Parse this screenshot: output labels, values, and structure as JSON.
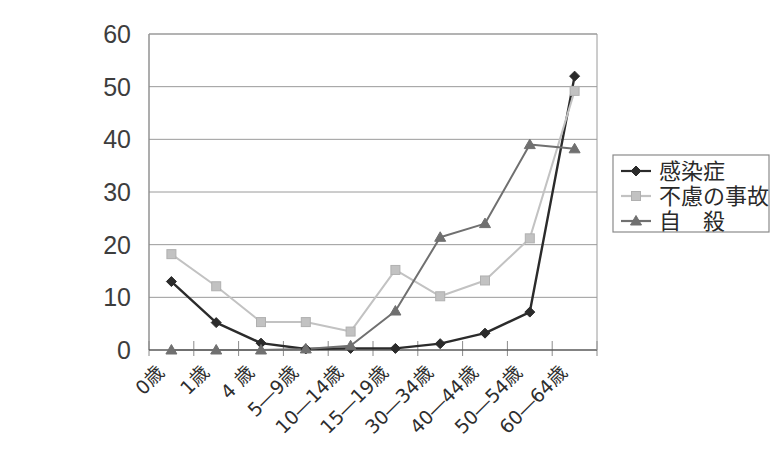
{
  "title_remnant": "―――――――――――――――――――――――",
  "chart_data": {
    "type": "line",
    "title": "",
    "subtitle": "",
    "xlabel": "",
    "ylabel": "",
    "ylim": [
      0,
      60
    ],
    "ytick_step": 10,
    "yticks": [
      "0",
      "10",
      "20",
      "30",
      "40",
      "50",
      "60"
    ],
    "grid": true,
    "legend_position": "right",
    "categories": [
      "0歳",
      "1歳",
      "4 歳",
      "5―9歳",
      "10―14歳",
      "15―19歳",
      "30―34歳",
      "40―44歳",
      "50―54歳",
      "60―64歳"
    ],
    "series": [
      {
        "name": "感染症",
        "marker": "diamond",
        "color": "#2b2b2b",
        "values": [
          13.0,
          5.2,
          1.3,
          0.2,
          0.3,
          0.3,
          1.2,
          3.2,
          7.2,
          52.0
        ]
      },
      {
        "name": "不慮の事故",
        "marker": "square",
        "color": "#c2c2c2",
        "values": [
          18.2,
          12.1,
          5.3,
          5.3,
          3.5,
          15.2,
          10.2,
          13.2,
          21.2,
          49.2
        ]
      },
      {
        "name": "自　殺",
        "marker": "triangle",
        "color": "#707070",
        "values": [
          0.0,
          0.0,
          0.0,
          0.2,
          0.8,
          7.4,
          21.4,
          24.0,
          39.0,
          38.2
        ]
      }
    ]
  },
  "legend": {
    "items": [
      {
        "label": "感染症",
        "marker": "diamond",
        "color": "#2b2b2b"
      },
      {
        "label": "不慮の事故",
        "marker": "square",
        "color": "#c2c2c2"
      },
      {
        "label": "自　殺",
        "marker": "triangle",
        "color": "#707070"
      }
    ]
  },
  "colors": {
    "axis": "#8a8a8a",
    "grid": "#9a9a9a",
    "text": "#3a3a3a",
    "background": "#ffffff"
  }
}
